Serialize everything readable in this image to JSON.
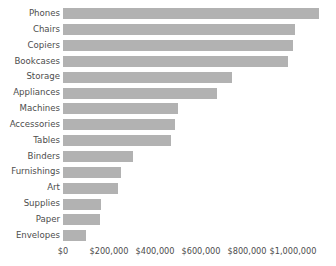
{
  "chart_data": {
    "type": "bar",
    "orientation": "horizontal",
    "title": "",
    "xlabel": "",
    "ylabel": "",
    "grid": false,
    "legend": null,
    "xlim": [
      0,
      1114000
    ],
    "categories": [
      "Phones",
      "Chairs",
      "Copiers",
      "Bookcases",
      "Storage",
      "Appliances",
      "Machines",
      "Accessories",
      "Tables",
      "Binders",
      "Furnishings",
      "Art",
      "Supplies",
      "Paper",
      "Envelopes"
    ],
    "values": [
      1114000,
      1008000,
      1000000,
      980000,
      735000,
      669000,
      498000,
      486000,
      469000,
      306000,
      253000,
      241000,
      167000,
      159000,
      102000
    ],
    "bar_color": "#b2b2b2",
    "xticks": [
      0,
      200000,
      400000,
      600000,
      800000,
      1000000
    ],
    "xtick_labels": [
      "$0",
      "$200,000",
      "$400,000",
      "$600,000",
      "$800,000",
      "$1,000,000"
    ]
  },
  "axis": {
    "text_color": "#4d4d4d"
  }
}
